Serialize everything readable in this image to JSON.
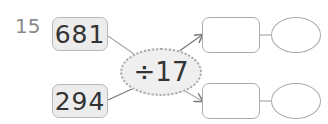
{
  "problem": {
    "number": "15",
    "inputs": [
      "681",
      "294"
    ],
    "operation": "÷17",
    "answers": [
      {
        "box": "",
        "circle": ""
      },
      {
        "box": "",
        "circle": ""
      }
    ]
  }
}
